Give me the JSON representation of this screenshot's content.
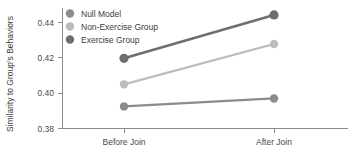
{
  "chart_data": {
    "type": "line",
    "title": "",
    "xlabel": "",
    "ylabel": "Similarity to Group's Behaviors",
    "categories": [
      "Before Join",
      "After Join"
    ],
    "ylim": [
      0.38,
      0.45
    ],
    "yticks": [
      "0.38",
      "0.40",
      "0.42",
      "0.44"
    ],
    "ytick_values": [
      0.38,
      0.4,
      0.42,
      0.44
    ],
    "grid": false,
    "legend_position": "top-left",
    "series": [
      {
        "name": "Null Model",
        "color": "#8c8c8c",
        "values": [
          0.3925,
          0.397
        ]
      },
      {
        "name": "Non-Exercise Group",
        "color": "#bcbcbc",
        "values": [
          0.405,
          0.4278
        ]
      },
      {
        "name": "Exercise Group",
        "color": "#6e6e6e",
        "values": [
          0.4197,
          0.4443
        ]
      }
    ]
  },
  "legend": {
    "items": [
      {
        "label": "Null Model",
        "color": "#8c8c8c"
      },
      {
        "label": "Non-Exercise Group",
        "color": "#bcbcbc"
      },
      {
        "label": "Exercise Group",
        "color": "#6e6e6e"
      }
    ]
  },
  "axes": {
    "y_title": "Similarity to Group's Behaviors",
    "y_ticks": [
      "0.44",
      "0.42",
      "0.40",
      "0.38"
    ],
    "x_ticks": [
      "Before Join",
      "After Join"
    ]
  }
}
